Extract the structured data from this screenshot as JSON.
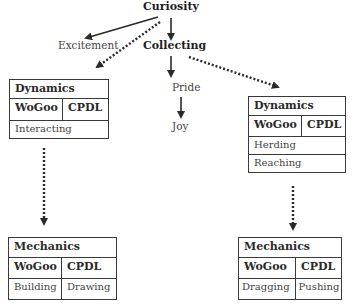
{
  "diagram": {
    "root": "Curiosity",
    "excitement": "Excitement",
    "collecting": "Collecting",
    "pride": "Pride",
    "joy": "Joy",
    "dynamics_left": {
      "title": "Dynamics",
      "col1": "WoGoo",
      "col2": "CPDL",
      "items": [
        "Interacting"
      ]
    },
    "dynamics_right": {
      "title": "Dynamics",
      "col1": "WoGoo",
      "col2": "CPDL",
      "items": [
        "Herding",
        "Reaching"
      ]
    },
    "mechanics_left": {
      "title": "Mechanics",
      "col1": "WoGoo",
      "col2": "CPDL",
      "wogoo_item": "Building",
      "cpdl_item": "Drawing"
    },
    "mechanics_right": {
      "title": "Mechanics",
      "col1": "WoGoo",
      "col2": "CPDL",
      "wogoo_item": "Dragging",
      "cpdl_item": "Pushing"
    },
    "edges": [
      {
        "from": "Curiosity",
        "to": "Excitement",
        "style": "solid"
      },
      {
        "from": "Curiosity",
        "to": "Collecting",
        "style": "solid"
      },
      {
        "from": "Curiosity",
        "to": "Dynamics (left)",
        "style": "dotted"
      },
      {
        "from": "Collecting",
        "to": "Pride",
        "style": "solid"
      },
      {
        "from": "Pride",
        "to": "Joy",
        "style": "solid"
      },
      {
        "from": "Collecting",
        "to": "Dynamics (right)",
        "style": "dotted"
      },
      {
        "from": "Dynamics (left)",
        "to": "Mechanics (left)",
        "style": "dotted"
      },
      {
        "from": "Dynamics (right)",
        "to": "Mechanics (right)",
        "style": "dotted"
      }
    ]
  },
  "colors": {
    "line": "#2a2a2a",
    "text": "#2a2a2a",
    "background": "#ffffff"
  }
}
